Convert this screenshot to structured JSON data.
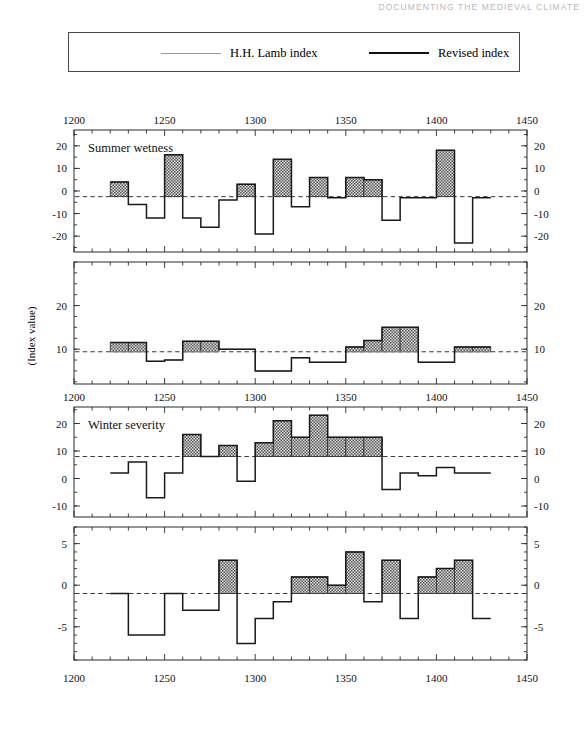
{
  "running_head": "DOCUMENTING THE MEDIEVAL CLIMATE",
  "legend": {
    "items": [
      {
        "label": "H.H. Lamb index",
        "style": "thin-line",
        "color": "#9a9a9a"
      },
      {
        "label": "Revised index",
        "style": "thick-line",
        "color": "#111111"
      }
    ]
  },
  "axis": {
    "y_label": "(Index value)",
    "x_ticks": [
      1200,
      1250,
      1300,
      1350,
      1400,
      1450
    ],
    "x_min": 1200,
    "x_max": 1450,
    "x_minor_step": 10
  },
  "colors": {
    "revised_line": "#1a1a1a",
    "lamb_line": "#8f8f8f",
    "reference_line": "#3b3b3b",
    "bar_fill": "#9c9c9c",
    "frame": "#2b2b2b"
  },
  "chart_data": [
    {
      "type": "bar",
      "panel": 1,
      "title": "Summer wetness",
      "xlabel": "",
      "ylabel": "(Index value)",
      "xlim": [
        1200,
        1450
      ],
      "ylim": [
        -27,
        27
      ],
      "yticks": [
        20,
        10,
        0,
        -10,
        -20
      ],
      "grid": false,
      "reference_value": -2.5,
      "x_axis_on_top": true,
      "categories": [
        1220,
        1230,
        1240,
        1250,
        1260,
        1270,
        1280,
        1290,
        1300,
        1310,
        1320,
        1330,
        1340,
        1350,
        1360,
        1370,
        1380,
        1390,
        1400,
        1410,
        1420
      ],
      "bin_width": 10,
      "series": [
        {
          "name": "Revised index",
          "values": [
            4,
            -6,
            -12,
            16,
            -12,
            -16,
            -4,
            3,
            -19,
            14,
            -7,
            6,
            -3,
            6,
            5,
            -13,
            -3,
            -3,
            18,
            -23,
            -3
          ]
        }
      ]
    },
    {
      "type": "bar",
      "panel": 2,
      "title": "",
      "xlabel": "",
      "ylabel": "(Index value)",
      "xlim": [
        1200,
        1450
      ],
      "ylim": [
        2,
        30
      ],
      "yticks": [
        20,
        10
      ],
      "grid": false,
      "reference_value": 9.4,
      "categories": [
        1220,
        1230,
        1240,
        1250,
        1260,
        1270,
        1280,
        1290,
        1300,
        1310,
        1320,
        1330,
        1340,
        1350,
        1360,
        1370,
        1380,
        1390,
        1400,
        1410,
        1420
      ],
      "bin_width": 10,
      "series": [
        {
          "name": "Revised index",
          "values": [
            11.5,
            11.5,
            7.2,
            7.5,
            11.8,
            11.8,
            10,
            10,
            5,
            5,
            8,
            7,
            7,
            10.5,
            12,
            15,
            15,
            7,
            7,
            10.5,
            10.5
          ]
        },
        {
          "name": "H.H. Lamb index",
          "values": [
            9.4,
            9.4,
            7.2,
            7.5,
            9.4,
            9.4,
            10,
            10,
            5,
            5,
            8,
            7,
            7,
            9.4,
            9.4,
            9.4,
            9.4,
            7,
            7,
            9.4,
            9.4
          ]
        }
      ],
      "note": "Shaded bars span from the Lamb baseline up to the revised value"
    },
    {
      "type": "bar",
      "panel": 3,
      "title": "Winter severity",
      "xlabel": "",
      "ylabel": "(Index value)",
      "xlim": [
        1200,
        1450
      ],
      "ylim": [
        -14,
        26
      ],
      "yticks": [
        20,
        10,
        0,
        -10
      ],
      "grid": false,
      "reference_value": 8,
      "categories": [
        1220,
        1230,
        1240,
        1250,
        1260,
        1270,
        1280,
        1290,
        1300,
        1310,
        1320,
        1330,
        1340,
        1350,
        1360,
        1370,
        1380,
        1390,
        1400,
        1410,
        1420
      ],
      "bin_width": 10,
      "series": [
        {
          "name": "Revised index",
          "values": [
            2,
            6,
            -7,
            2,
            16,
            8,
            12,
            -1,
            13,
            21,
            15,
            23,
            15,
            15,
            15,
            -4,
            2,
            1,
            4,
            2,
            2
          ]
        }
      ]
    },
    {
      "type": "bar",
      "panel": 4,
      "title": "",
      "xlabel": "",
      "ylabel": "(Index value)",
      "xlim": [
        1200,
        1450
      ],
      "ylim": [
        -9,
        7
      ],
      "yticks": [
        5,
        0,
        -5
      ],
      "grid": false,
      "reference_value": -1,
      "categories": [
        1220,
        1230,
        1240,
        1250,
        1260,
        1270,
        1280,
        1290,
        1300,
        1310,
        1320,
        1330,
        1340,
        1350,
        1360,
        1370,
        1380,
        1390,
        1400,
        1410,
        1420
      ],
      "bin_width": 10,
      "series": [
        {
          "name": "Revised index",
          "values": [
            -1,
            -6,
            -6,
            -1,
            -3,
            -3,
            3,
            -7,
            -4,
            -2,
            1,
            1,
            0,
            4,
            -2,
            3,
            -4,
            1,
            2,
            3,
            -4
          ]
        }
      ]
    }
  ]
}
